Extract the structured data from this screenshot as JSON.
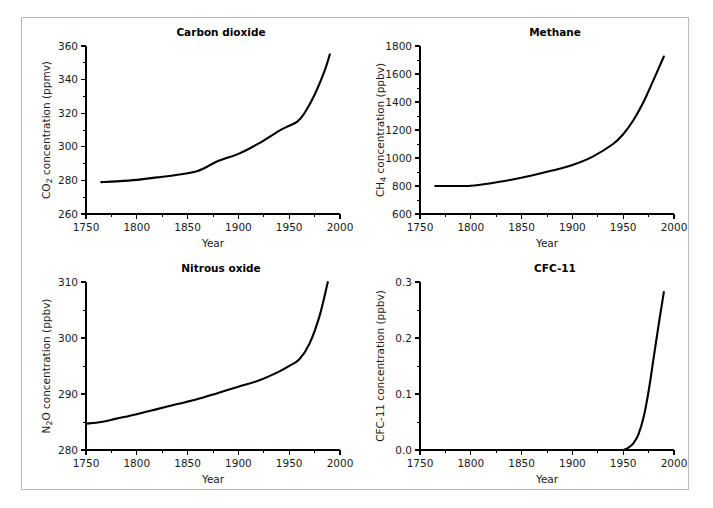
{
  "figure": {
    "panels": [
      {
        "id": "carbon-dioxide",
        "title": "Carbon dioxide",
        "ylabel_main": "CO",
        "ylabel_sub": "2",
        "ylabel_rest": " concentration (ppmv)",
        "xlabel": "Year"
      },
      {
        "id": "methane",
        "title": "Methane",
        "ylabel_main": "CH",
        "ylabel_sub": "4",
        "ylabel_rest": " concentration (ppbv)",
        "xlabel": "Year"
      },
      {
        "id": "nitrous-oxide",
        "title": "Nitrous oxide",
        "ylabel_main": "N",
        "ylabel_sub": "2",
        "ylabel_rest": "O concentration (ppbv)",
        "xlabel": "Year"
      },
      {
        "id": "cfc-11",
        "title": "CFC-11",
        "ylabel_main": "CFC-11",
        "ylabel_sub": "",
        "ylabel_rest": " concentration (ppbv)",
        "xlabel": "Year"
      }
    ],
    "line_color": "#000000",
    "frame_color": "#b9b9b9",
    "background": "#ffffff"
  },
  "chart_data": [
    {
      "type": "line",
      "title": "Carbon dioxide",
      "xlabel": "Year",
      "ylabel": "CO2 concentration (ppmv)",
      "xlim": [
        1750,
        2000
      ],
      "ylim": [
        260,
        360
      ],
      "xticks": [
        1750,
        1800,
        1850,
        1900,
        1950,
        2000
      ],
      "xticklabels": [
        "1750",
        "1800",
        "1850",
        "1900",
        "1950",
        "2000"
      ],
      "yticks": [
        260,
        280,
        300,
        320,
        340,
        360
      ],
      "yticklabels": [
        "260",
        "280",
        "300",
        "320",
        "340",
        "360"
      ],
      "x_minor_interval": 25,
      "y_minor_interval": 10,
      "grid": false,
      "legend": null,
      "series": [
        {
          "name": "CO2",
          "x": [
            1765,
            1780,
            1800,
            1820,
            1840,
            1860,
            1880,
            1900,
            1920,
            1940,
            1950,
            1958,
            1965,
            1975,
            1985,
            1990
          ],
          "y": [
            279.0,
            279.4,
            280.3,
            281.8,
            283.4,
            285.6,
            291.5,
            295.8,
            302.0,
            309.5,
            312.5,
            315.0,
            320.0,
            331.0,
            345.5,
            355.0
          ]
        }
      ]
    },
    {
      "type": "line",
      "title": "Methane",
      "xlabel": "Year",
      "ylabel": "CH4 concentration (ppbv)",
      "xlim": [
        1750,
        2000
      ],
      "ylim": [
        600,
        1800
      ],
      "xticks": [
        1750,
        1800,
        1850,
        1900,
        1950,
        2000
      ],
      "xticklabels": [
        "1750",
        "1800",
        "1850",
        "1900",
        "1950",
        "2000"
      ],
      "yticks": [
        600,
        800,
        1000,
        1200,
        1400,
        1600,
        1800
      ],
      "yticklabels": [
        "600",
        "800",
        "1000",
        "1200",
        "1400",
        "1600",
        "1800"
      ],
      "x_minor_interval": 25,
      "y_minor_interval": 100,
      "grid": false,
      "legend": null,
      "series": [
        {
          "name": "CH4",
          "x": [
            1765,
            1780,
            1800,
            1820,
            1840,
            1860,
            1880,
            1900,
            1920,
            1940,
            1950,
            1960,
            1970,
            1980,
            1990
          ],
          "y": [
            800,
            800,
            802,
            820,
            845,
            875,
            910,
            950,
            1010,
            1100,
            1170,
            1270,
            1400,
            1560,
            1725
          ]
        }
      ]
    },
    {
      "type": "line",
      "title": "Nitrous oxide",
      "xlabel": "Year",
      "ylabel": "N2O concentration (ppbv)",
      "xlim": [
        1750,
        2000
      ],
      "ylim": [
        280,
        310
      ],
      "xticks": [
        1750,
        1800,
        1850,
        1900,
        1950,
        2000
      ],
      "xticklabels": [
        "1750",
        "1800",
        "1850",
        "1900",
        "1950",
        "2000"
      ],
      "yticks": [
        280,
        290,
        300,
        310
      ],
      "yticklabels": [
        "280",
        "290",
        "300",
        "310"
      ],
      "x_minor_interval": 25,
      "y_minor_interval": 5,
      "grid": false,
      "legend": null,
      "series": [
        {
          "name": "N2O",
          "x": [
            1750,
            1765,
            1780,
            1800,
            1820,
            1840,
            1860,
            1880,
            1900,
            1920,
            1940,
            1950,
            1960,
            1970,
            1980,
            1988
          ],
          "y": [
            284.7,
            285.0,
            285.6,
            286.4,
            287.3,
            288.2,
            289.1,
            290.2,
            291.3,
            292.4,
            294.0,
            295.0,
            296.2,
            299.0,
            304.0,
            310.0
          ]
        }
      ]
    },
    {
      "type": "line",
      "title": "CFC-11",
      "xlabel": "Year",
      "ylabel": "CFC-11 concentration (ppbv)",
      "xlim": [
        1750,
        2000
      ],
      "ylim": [
        0.0,
        0.3
      ],
      "xticks": [
        1750,
        1800,
        1850,
        1900,
        1950,
        2000
      ],
      "xticklabels": [
        "1750",
        "1800",
        "1850",
        "1900",
        "1950",
        "2000"
      ],
      "yticks": [
        0.0,
        0.1,
        0.2,
        0.3
      ],
      "yticklabels": [
        "0.0",
        "0.1",
        "0.2",
        "0.3"
      ],
      "x_minor_interval": 25,
      "y_minor_interval": 0.05,
      "grid": false,
      "legend": null,
      "series": [
        {
          "name": "CFC-11",
          "x": [
            1950,
            1955,
            1960,
            1965,
            1970,
            1975,
            1980,
            1985,
            1990
          ],
          "y": [
            0.0,
            0.004,
            0.012,
            0.028,
            0.058,
            0.105,
            0.165,
            0.225,
            0.282
          ]
        }
      ]
    }
  ]
}
